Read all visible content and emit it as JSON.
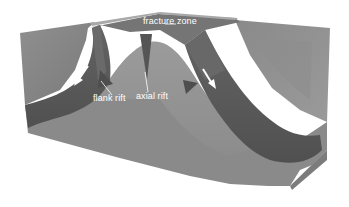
{
  "diagram": {
    "type": "3d-block-diagram",
    "labels": {
      "fracture_zone": "fracture zone",
      "flank_rift": "flank rift",
      "axial_rift": "axial rift"
    },
    "arrows": [
      {
        "name": "left-flank-downslope-arrow",
        "direction": "down-left"
      },
      {
        "name": "right-flank-downslope-arrow",
        "direction": "down-right"
      }
    ],
    "colors": {
      "background": "#ffffff",
      "block_front": "#8a8a8a",
      "block_top_light": "#9a9a9a",
      "block_side": "#7e7e7e",
      "dark_layer": "#5a5a5a",
      "ridge_core": "#8c8c8c",
      "label_text": "#ffffff",
      "arrow": "#ffffff"
    }
  }
}
